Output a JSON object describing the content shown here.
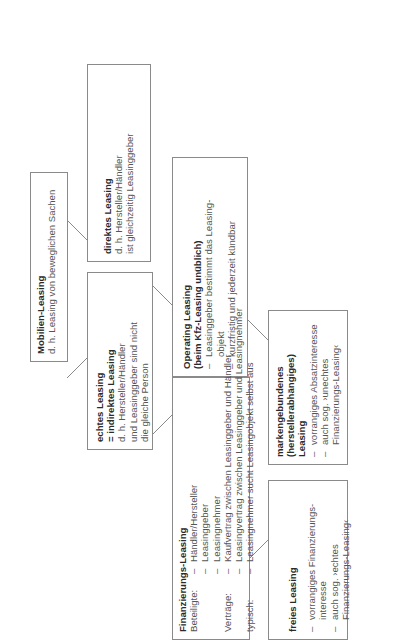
{
  "diagram": {
    "root": {
      "title": "Mobilien-Leasing",
      "lines": [
        "d. h. Leasing von beweglichen Sachen"
      ]
    },
    "direct": {
      "title": "direktes Leasing",
      "lines": [
        "d. h. Hersteller/Händler",
        "ist gleichzeitig Leasinggeber"
      ]
    },
    "genuine": {
      "title_lines": [
        "echtes Leasing",
        "= indirektes Leasing"
      ],
      "lines": [
        "d. h. Hersteller/Händler",
        "und Leasinggeber sind nicht",
        "die gleiche Person"
      ]
    },
    "operating": {
      "title_lines": [
        "Operating Leasing",
        "(beim Kfz-Leasing unüblich)"
      ],
      "items": [
        {
          "dash": "–",
          "lines": [
            "Leasinggeber bestimmt das Leasing-",
            "objekt"
          ]
        },
        {
          "dash": "–",
          "lines": [
            "kurzfristig und jederzeit kündbar"
          ]
        }
      ]
    },
    "financing": {
      "title": "Finanzierungs-Leasing",
      "rows": [
        {
          "label": "Beteiligte:",
          "items": [
            "Händler/Hersteller",
            "Leasinggeber",
            "Leasingnehmer"
          ]
        },
        {
          "label": "Verträge:",
          "items": [
            "Kaufvertrag zwischen Leasinggeber und Händler",
            "Leasingvertrag zwischen Leasinggeber und Leasingnehmer"
          ]
        },
        {
          "label": "typisch:",
          "items": [
            "Leasingnehmer sucht Leasingobjekt selbst aus"
          ]
        }
      ],
      "dash": "–"
    },
    "brand_bound": {
      "title_lines": [
        "markengebundenes",
        "(herstellerabhängiges)",
        "Leasing"
      ],
      "items": [
        {
          "dash": "–",
          "lines": [
            "vorrangiges Absatzinteresse"
          ]
        },
        {
          "dash": "–",
          "lines": [
            "auch sog. ›unechtes",
            "Finanzierungs-Leasing‹"
          ]
        }
      ]
    },
    "free": {
      "title": "freies Leasing",
      "items": [
        {
          "dash": "–",
          "lines": [
            "vorrangiges Finanzierungs-",
            "interesse"
          ]
        },
        {
          "dash": "–",
          "lines": [
            "auch sog. ›echtes",
            "Finanzierungs-Leasing‹"
          ]
        }
      ]
    }
  }
}
